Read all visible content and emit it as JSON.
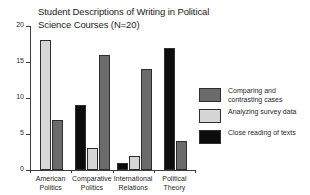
{
  "chart_data": {
    "type": "bar",
    "title": "Student Descriptions of Writing in Political Science Courses (N=20)",
    "xlabel": "",
    "ylabel": "",
    "ylim": [
      0,
      20
    ],
    "yticks": [
      0,
      5,
      10,
      15,
      20
    ],
    "ytick_labels": [
      "0",
      "5",
      "10",
      "15",
      "20"
    ],
    "grid": false,
    "legend_position": "right",
    "categories": [
      "American\nPolitics",
      "Comparative\nPolitics",
      "International\nRelations",
      "Political\nTheory"
    ],
    "series": [
      {
        "name": "Comparing and\ncontrasting cases",
        "color": "#6b6b6b",
        "values": [
          7,
          16,
          14,
          4
        ]
      },
      {
        "name": "Analyzing survey data",
        "color": "#d6d6d6",
        "values": [
          18,
          3,
          2,
          0
        ]
      },
      {
        "name": "Close reading of texts",
        "color": "#0d0d0d",
        "values": [
          0,
          9,
          1,
          17
        ]
      }
    ],
    "groups": [
      {
        "label": "American\nPolitics",
        "bars": [
          {
            "series": "Analyzing survey data",
            "value": 18,
            "color": "#d6d6d6"
          },
          {
            "series": "Comparing and contrasting cases",
            "value": 7,
            "color": "#6b6b6b"
          }
        ]
      },
      {
        "label": "Comparative\nPolitics",
        "bars": [
          {
            "series": "Close reading of texts",
            "value": 9,
            "color": "#0d0d0d"
          },
          {
            "series": "Analyzing survey data",
            "value": 3,
            "color": "#d6d6d6"
          },
          {
            "series": "Comparing and contrasting cases",
            "value": 16,
            "color": "#6b6b6b"
          }
        ]
      },
      {
        "label": "International\nRelations",
        "bars": [
          {
            "series": "Close reading of texts",
            "value": 1,
            "color": "#0d0d0d"
          },
          {
            "series": "Analyzing survey data",
            "value": 2,
            "color": "#d6d6d6"
          },
          {
            "series": "Comparing and contrasting cases",
            "value": 14,
            "color": "#6b6b6b"
          }
        ]
      },
      {
        "label": "Political\nTheory",
        "bars": [
          {
            "series": "Close reading of texts",
            "value": 17,
            "color": "#0d0d0d"
          },
          {
            "series": "Comparing and contrasting cases",
            "value": 4,
            "color": "#6b6b6b"
          }
        ]
      }
    ],
    "legend": [
      {
        "label": "Comparing and\ncontrasting cases",
        "color": "#6b6b6b"
      },
      {
        "label": "Analyzing survey data",
        "color": "#d6d6d6"
      },
      {
        "label": "Close reading of texts",
        "color": "#0d0d0d"
      }
    ]
  }
}
